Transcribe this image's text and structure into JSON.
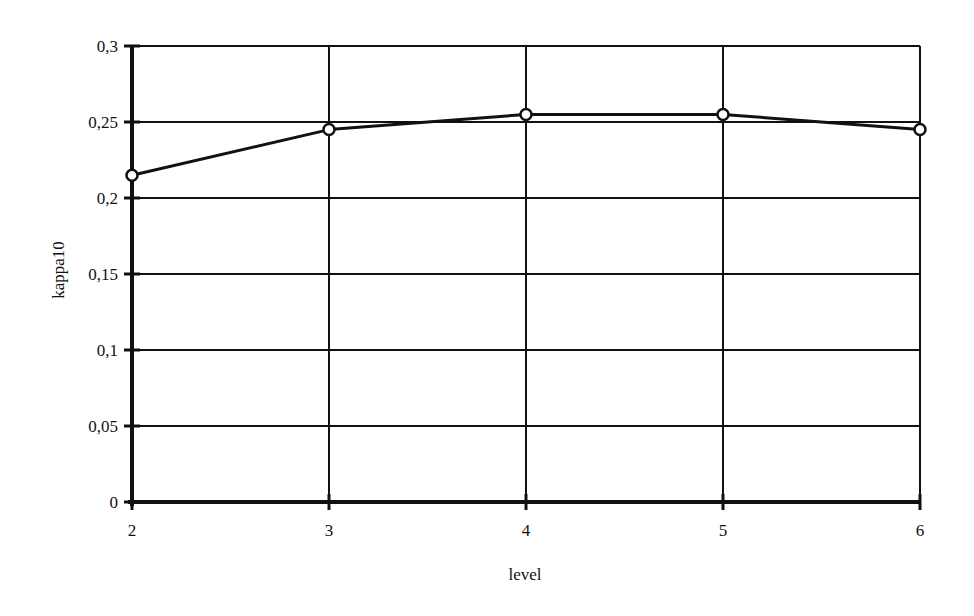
{
  "chart_data": {
    "type": "line",
    "title": "",
    "xlabel": "level",
    "ylabel": "kappa10",
    "x": [
      2,
      3,
      4,
      5,
      6
    ],
    "categories": [
      "2",
      "3",
      "4",
      "5",
      "6"
    ],
    "series": [
      {
        "name": "kappa10",
        "values": [
          0.215,
          0.245,
          0.255,
          0.255,
          0.245
        ],
        "marker": "open-circle",
        "color": "#111111"
      }
    ],
    "ylim": [
      0,
      0.3
    ],
    "xlim": [
      2,
      6
    ],
    "yticks": [
      0,
      0.05,
      0.1,
      0.15,
      0.2,
      0.25,
      0.3
    ],
    "ytick_labels": [
      "0",
      "0,05",
      "0,1",
      "0,15",
      "0,2",
      "0,25",
      "0,3"
    ],
    "xtick_labels": [
      "2",
      "3",
      "4",
      "5",
      "6"
    ],
    "grid": true,
    "legend": null
  },
  "colors": {
    "ink": "#111111",
    "background": "#ffffff"
  }
}
